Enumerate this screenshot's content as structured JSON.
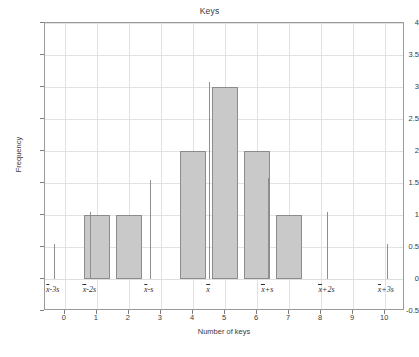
{
  "chart_data": {
    "type": "bar",
    "title": "Keys",
    "xlabel": "Number of keys",
    "ylabel": "Frequency",
    "categories": [
      0,
      1,
      2,
      3,
      4,
      5,
      6,
      7,
      8,
      9,
      10
    ],
    "values": [
      0,
      1,
      1,
      0,
      2,
      3,
      2,
      1,
      0,
      0,
      0
    ],
    "bars": [
      {
        "x": 1,
        "height": 1
      },
      {
        "x": 2,
        "height": 1
      },
      {
        "x": 4,
        "height": 2
      },
      {
        "x": 5,
        "height": 3
      },
      {
        "x": 6,
        "height": 2
      },
      {
        "x": 7,
        "height": 1
      }
    ],
    "bar_width": 0.8,
    "xlim": [
      -0.62,
      10.62
    ],
    "ylim": [
      -0.5,
      4
    ],
    "xticks": [
      0,
      1,
      2,
      3,
      4,
      5,
      6,
      7,
      8,
      9,
      10
    ],
    "xtick_labels": [
      "0",
      "1",
      "2",
      "3",
      "4",
      "5",
      "6",
      "7",
      "8",
      "9",
      "10"
    ],
    "yticks": [
      -0.5,
      0,
      0.5,
      1,
      1.5,
      2,
      2.5,
      3,
      3.5,
      4
    ],
    "ytick_labels": [
      "-0.5",
      "0",
      "0.5",
      "1",
      "1.5",
      "2",
      "2.5",
      "3",
      "3.5",
      "4"
    ],
    "grid": true,
    "legend": "none",
    "bar_fill_color": "#c9c9c9",
    "bar_edge_color": "#8c8c8c",
    "grid_color": "#e2e2e2",
    "axis_color": "#9a9a9a",
    "reference_lines": [
      {
        "id": "mean-minus-3s",
        "x": -0.35,
        "top": 0.55,
        "prefix": "x",
        "suffix": "-3s",
        "label": "x̄-3s"
      },
      {
        "id": "mean-minus-2s",
        "x": 0.8,
        "top": 1.05,
        "prefix": "x",
        "suffix": "-2s",
        "label": "x̄-2s"
      },
      {
        "id": "mean-minus-1s",
        "x": 2.65,
        "top": 1.55,
        "prefix": "x",
        "suffix": "-s",
        "label": "x̄-s"
      },
      {
        "id": "mean",
        "x": 4.5,
        "top": 3.08,
        "prefix": "x",
        "suffix": "",
        "label": "x̄"
      },
      {
        "id": "mean-plus-1s",
        "x": 6.35,
        "top": 1.58,
        "prefix": "x",
        "suffix": "+s",
        "label": "x̄+s"
      },
      {
        "id": "mean-plus-2s",
        "x": 8.2,
        "top": 1.05,
        "prefix": "x",
        "suffix": "+2s",
        "label": "x̄+2s"
      },
      {
        "id": "mean-plus-3s",
        "x": 10.05,
        "top": 0.55,
        "prefix": "x",
        "suffix": "+3s",
        "label": "x̄+3s"
      }
    ]
  }
}
